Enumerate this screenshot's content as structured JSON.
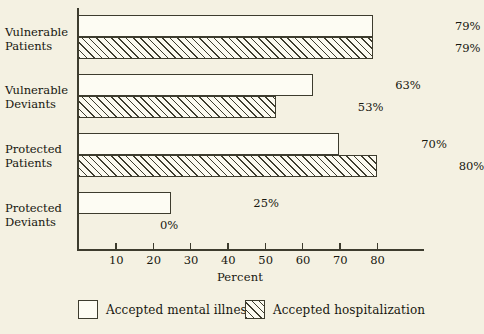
{
  "chart_data": {
    "type": "bar",
    "orientation": "horizontal",
    "title": "",
    "xlabel": "Percent",
    "ylabel": "",
    "xlim": [
      0,
      88
    ],
    "ylim": null,
    "grid": false,
    "legend_position": "bottom",
    "xticks": [
      10,
      20,
      30,
      40,
      50,
      60,
      70,
      80
    ],
    "xtick_labels": [
      "10",
      "20",
      "30",
      "40",
      "50",
      "60",
      "70",
      "80"
    ],
    "categories": [
      "Vulnerable\nPatients",
      "Vulnerable\nDeviants",
      "Protected\nPatients",
      "Protected\nDeviants"
    ],
    "series": [
      {
        "name": "Accepted mental illness",
        "pattern": "solid-outline",
        "values": [
          79,
          63,
          70,
          25
        ],
        "value_labels": [
          "79%",
          "63%",
          "70%",
          "25%"
        ]
      },
      {
        "name": "Accepted hospitalization",
        "pattern": "diagonal-hatch",
        "values": [
          79,
          53,
          80,
          0
        ],
        "value_labels": [
          "79%",
          "53%",
          "80%",
          "0%"
        ]
      }
    ]
  },
  "colors": {
    "background": "#f4f1e2",
    "ink": "#3d3c2e",
    "bar_fill": "#fdfcf3",
    "text": "#17170f"
  }
}
